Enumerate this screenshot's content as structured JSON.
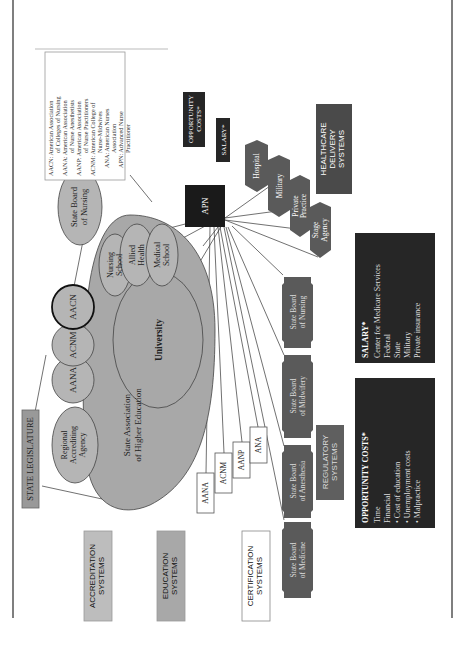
{
  "colors": {
    "ellipse_fill": "#b3b3b3",
    "big_ellipse_fill": "#a8a8a8",
    "dark_box": "#262626",
    "hex_fill": "#5a5a5a",
    "light_box": "#b0b0b0",
    "line": "#333333",
    "page_border": "#555555"
  },
  "labels": {
    "state_legislature": "STATE LEGISLATURE",
    "regional_accrediting": [
      "Regional",
      "Accrediting",
      "Agency"
    ],
    "state_assoc_higher_ed": [
      "State Association",
      "of Higher Education"
    ],
    "aana": "AANA",
    "acnm": "ACNM",
    "aacn": "AACN",
    "state_board_nursing_top": [
      "State Board",
      "of Nursing"
    ],
    "nursing_school": [
      "Nursing",
      "School"
    ],
    "allied_health": [
      "Allied",
      "Health"
    ],
    "medical_school": [
      "Medical",
      "School"
    ],
    "university": "University",
    "apn": "APN",
    "opportunity_costs_small": [
      "OPPORTUNITY",
      "COSTS*"
    ],
    "salary_small": "SALARY*",
    "hospital": "Hospital",
    "military": "Military",
    "private_practice": [
      "Private",
      "Practice"
    ],
    "stage_agency": [
      "Stage",
      "Agency"
    ],
    "healthcare_delivery": [
      "HEALTHCARE",
      "DELIVERY",
      "SYSTEMS"
    ],
    "accreditation_systems": [
      "ACCREDITATION",
      "SYSTEMS"
    ],
    "education_systems": [
      "EDUCATION",
      "SYSTEMS"
    ],
    "certification_systems": [
      "CERTIFICATION",
      "SYSTEMS"
    ],
    "regulatory_systems": [
      "REGULATORY",
      "SYSTEMS"
    ],
    "cert_boxes": [
      "AANA",
      "ACNM",
      "AANP",
      "ANA"
    ],
    "state_board_medicine": [
      "State Board",
      "of Medicine"
    ],
    "state_board_anesthesia": [
      "State Board",
      "of Anesthesia"
    ],
    "state_board_midwifery": [
      "State Board",
      "of Midwifery"
    ],
    "state_board_nursing_reg": [
      "State Board",
      "of Nursing"
    ]
  },
  "legend": [
    {
      "abbr": "AACN:",
      "lines": [
        "American Association",
        "of Colleges of Nursing"
      ]
    },
    {
      "abbr": "AANA:",
      "lines": [
        "American Association",
        "of Nurse Anesthetists"
      ]
    },
    {
      "abbr": "AANP:",
      "lines": [
        "American Association",
        "of Nurse Practitioners"
      ]
    },
    {
      "abbr": "ACNM:",
      "lines": [
        "American College of",
        "Nurse-Midwives"
      ]
    },
    {
      "abbr": "ANA:",
      "lines": [
        "American Nurses",
        "Association"
      ]
    },
    {
      "abbr": "APN:",
      "lines": [
        "Advanced Nurse",
        "Practitioner"
      ]
    }
  ],
  "salary_box": {
    "title": "SALARY*",
    "items": [
      "Center for Medicare Services",
      "Federal",
      "State",
      "Military",
      "Private insurance"
    ]
  },
  "opportunity_box": {
    "title": "OPPORTUNITY COSTS*",
    "items": [
      "Time",
      "Financial",
      "• Cost of education",
      "• Unemployment costs",
      "• Malpractice"
    ]
  }
}
